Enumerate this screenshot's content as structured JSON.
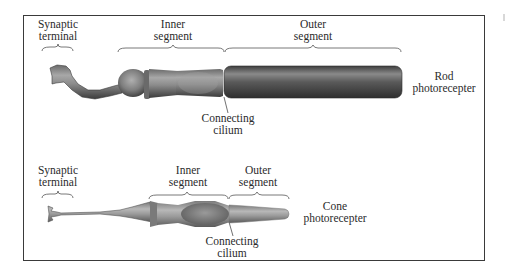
{
  "figure": {
    "rod": {
      "synaptic_terminal": [
        "Synaptic",
        "terminal"
      ],
      "inner_segment": [
        "Inner",
        "segment"
      ],
      "outer_segment": [
        "Outer",
        "segment"
      ],
      "connecting_cilium": [
        "Connecting",
        "cilium"
      ],
      "name": [
        "Rod",
        "photorecepter"
      ]
    },
    "cone": {
      "synaptic_terminal": [
        "Synaptic",
        "terminal"
      ],
      "inner_segment": [
        "Inner",
        "segment"
      ],
      "outer_segment": [
        "Outer",
        "segment"
      ],
      "connecting_cilium": [
        "Connecting",
        "cilium"
      ],
      "name": [
        "Cone",
        "photorecepter"
      ]
    }
  },
  "colors": {
    "frame": "#3a3a3a",
    "cell_dark": "#4a4a4a",
    "cell_mid": "#8a8a8a",
    "cell_light": "#b5b5b5",
    "text": "#2b2b2b"
  }
}
